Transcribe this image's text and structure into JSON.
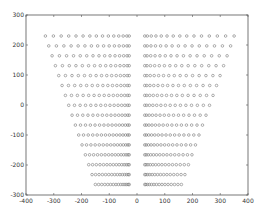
{
  "chart_data": {
    "type": "scatter",
    "title": "",
    "xlabel": "",
    "ylabel": "",
    "xlim": [
      -400,
      400
    ],
    "ylim": [
      -300,
      300
    ],
    "xticks": [
      -400,
      -300,
      -200,
      -100,
      0,
      100,
      200,
      300,
      400
    ],
    "yticks": [
      -300,
      -200,
      -100,
      0,
      100,
      200,
      300
    ],
    "grid": false,
    "legend": null,
    "marker": "circle",
    "marker_color": "#777777",
    "series": [
      {
        "name": "left-grid",
        "rows": 16,
        "cols": 15,
        "top_row": {
          "y": 230,
          "x_start": -330,
          "x_end": -28
        },
        "bottom_row": {
          "y": -265,
          "x_start": -150,
          "x_end": -28
        }
      },
      {
        "name": "right-grid",
        "rows": 16,
        "cols": 15,
        "top_row": {
          "y": 230,
          "x_start": 28,
          "x_end": 350
        },
        "bottom_row": {
          "y": -265,
          "x_start": 28,
          "x_end": 160
        }
      }
    ]
  }
}
